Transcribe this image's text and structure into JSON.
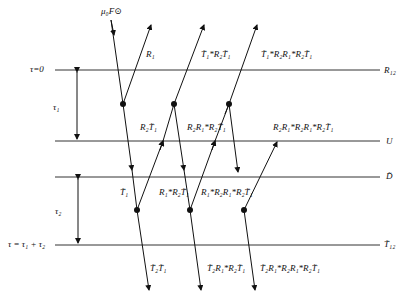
{
  "diagram": {
    "incident_label": "μ₀F⊙",
    "levels": [
      {
        "id": "top",
        "left_label": "τ=0",
        "right_label": "R₁₂",
        "y": 70
      },
      {
        "id": "u",
        "left_label": "",
        "right_label": "U",
        "y": 141
      },
      {
        "id": "d",
        "left_label": "",
        "right_label": "D̃",
        "y": 177
      },
      {
        "id": "bottom",
        "left_label": "τ = τ₁ + τ₂",
        "right_label": "T̃₁₂",
        "y": 245
      }
    ],
    "thickness_labels": {
      "layer1": "τ₁",
      "layer2": "τ₂"
    },
    "upward_labels": [
      "R₁",
      "T̃₁*R₂T̃₁",
      "T̃₁*R₂R₁*R₂T̃₁"
    ],
    "layer1_internal_labels": [
      "R₂T̃₁",
      "R₂R₁*R₂T̃₁",
      "R₂R₁*R₂R₁*R₂T̃₁"
    ],
    "layer2_internal_labels": [
      "T̃₁",
      "R₁*R₂T̃₁",
      "R₁*R₂R₁*R₂T̃₁"
    ],
    "downward_labels": [
      "T̃₂T̃₁",
      "T̃₂R₁*R₂T̃₁",
      "T̃₂R₁*R₂R₁*R₂T̃₁"
    ]
  }
}
